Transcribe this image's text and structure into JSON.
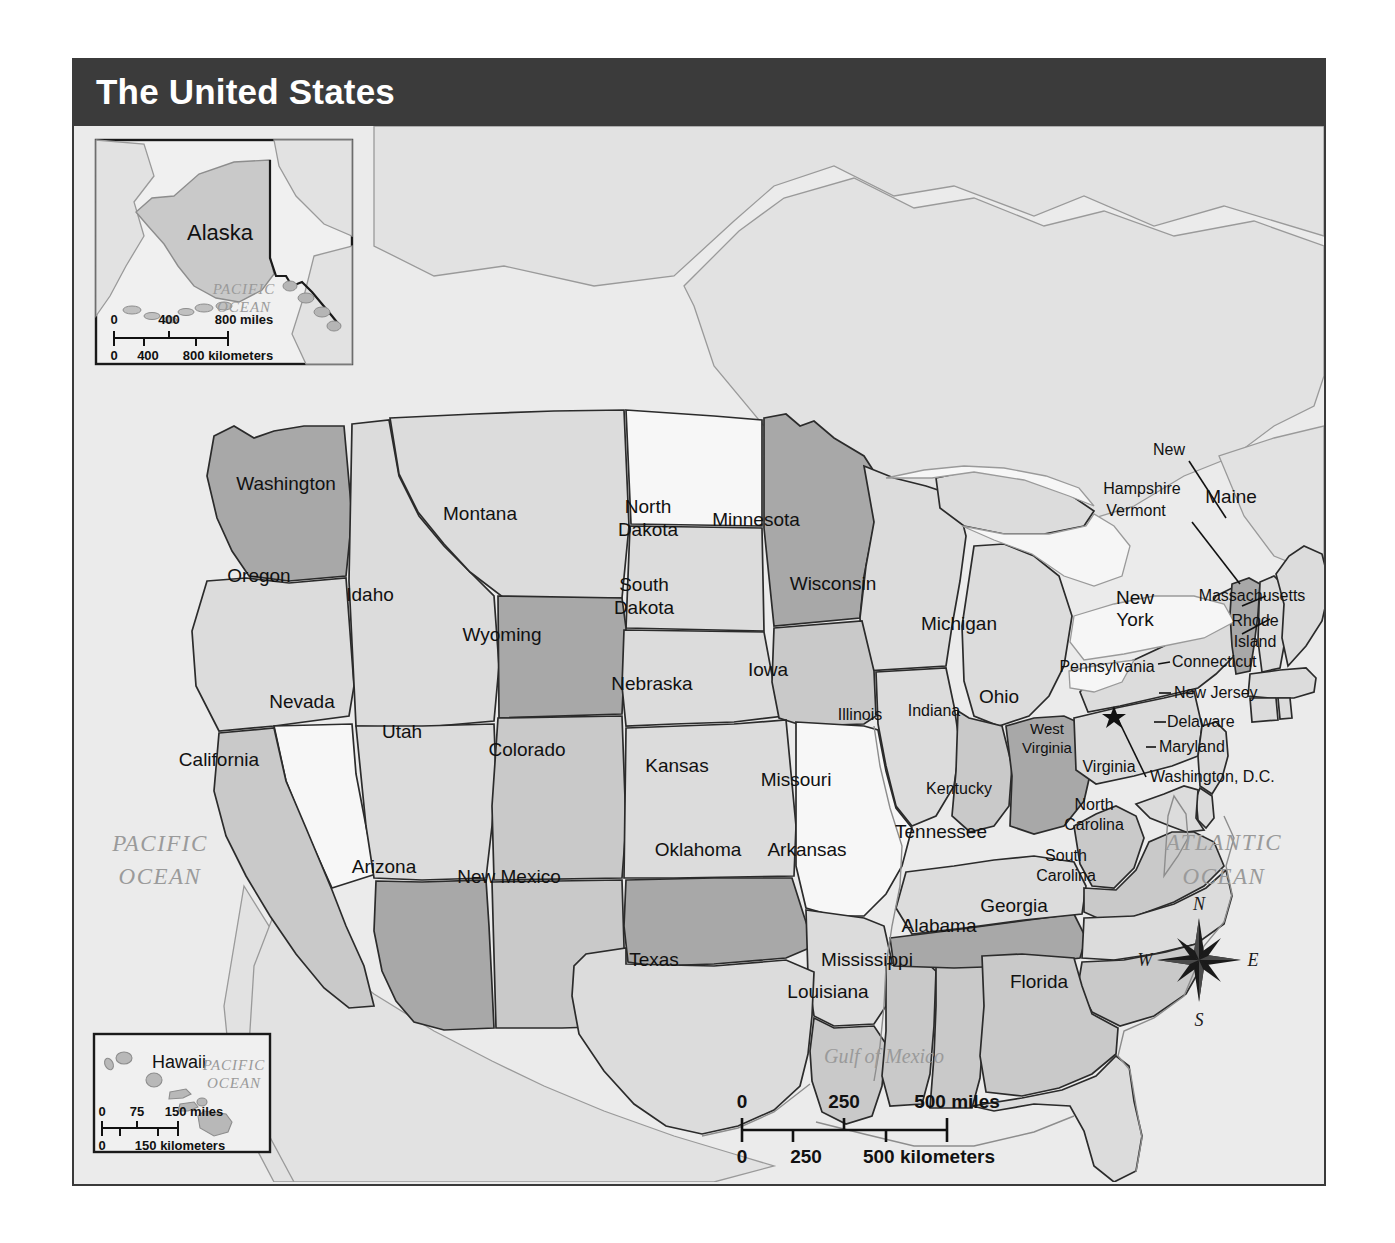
{
  "title": "The United States",
  "map": {
    "background_color": "#ebebeb",
    "title_bar_color": "#3b3b3b",
    "border_color": "#3a3a3a"
  },
  "state_labels": [
    {
      "name": "Washington",
      "line2": ""
    },
    {
      "name": "Oregon",
      "line2": ""
    },
    {
      "name": "Idaho",
      "line2": ""
    },
    {
      "name": "Montana",
      "line2": ""
    },
    {
      "name": "North",
      "line2": "Dakota"
    },
    {
      "name": "South",
      "line2": "Dakota"
    },
    {
      "name": "Minnesota",
      "line2": ""
    },
    {
      "name": "Wisconsin",
      "line2": ""
    },
    {
      "name": "Michigan",
      "line2": ""
    },
    {
      "name": "Wyoming",
      "line2": ""
    },
    {
      "name": "Nebraska",
      "line2": ""
    },
    {
      "name": "Iowa",
      "line2": ""
    },
    {
      "name": "Illinois",
      "line2": ""
    },
    {
      "name": "Indiana",
      "line2": ""
    },
    {
      "name": "Ohio",
      "line2": ""
    },
    {
      "name": "Nevada",
      "line2": ""
    },
    {
      "name": "Utah",
      "line2": ""
    },
    {
      "name": "Colorado",
      "line2": ""
    },
    {
      "name": "Kansas",
      "line2": ""
    },
    {
      "name": "Missouri",
      "line2": ""
    },
    {
      "name": "California",
      "line2": ""
    },
    {
      "name": "Arizona",
      "line2": ""
    },
    {
      "name": "New Mexico",
      "line2": ""
    },
    {
      "name": "Oklahoma",
      "line2": ""
    },
    {
      "name": "Arkansas",
      "line2": ""
    },
    {
      "name": "Texas",
      "line2": ""
    },
    {
      "name": "Louisiana",
      "line2": ""
    },
    {
      "name": "Mississippi",
      "line2": ""
    },
    {
      "name": "Alabama",
      "line2": ""
    },
    {
      "name": "Georgia",
      "line2": ""
    },
    {
      "name": "Florida",
      "line2": ""
    },
    {
      "name": "Tennessee",
      "line2": ""
    },
    {
      "name": "Kentucky",
      "line2": ""
    },
    {
      "name": "West",
      "line2": "Virginia"
    },
    {
      "name": "Virginia",
      "line2": ""
    },
    {
      "name": "North",
      "line2": "Carolina"
    },
    {
      "name": "South",
      "line2": "Carolina"
    },
    {
      "name": "Pennsylvania",
      "line2": ""
    },
    {
      "name": "New",
      "line2": "York"
    },
    {
      "name": "Maine",
      "line2": ""
    },
    {
      "name": "New",
      "line2": "Hampshire"
    },
    {
      "name": "Vermont",
      "line2": ""
    },
    {
      "name": "Massachusetts",
      "line2": ""
    },
    {
      "name": "Rhode",
      "line2": "Island"
    },
    {
      "name": "Connecticut",
      "line2": ""
    },
    {
      "name": "New Jersey",
      "line2": ""
    },
    {
      "name": "Delaware",
      "line2": ""
    },
    {
      "name": "Maryland",
      "line2": ""
    },
    {
      "name": "Washington, D.C.",
      "line2": ""
    },
    {
      "name": "Alaska",
      "line2": ""
    },
    {
      "name": "Hawaii",
      "line2": ""
    }
  ],
  "labels": {
    "washington": "Washington",
    "oregon": "Oregon",
    "idaho": "Idaho",
    "montana": "Montana",
    "north_dakota_1": "North",
    "north_dakota_2": "Dakota",
    "south_dakota_1": "South",
    "south_dakota_2": "Dakota",
    "minnesota": "Minnesota",
    "wisconsin": "Wisconsin",
    "michigan": "Michigan",
    "wyoming": "Wyoming",
    "nebraska": "Nebraska",
    "iowa": "Iowa",
    "illinois": "Illinois",
    "indiana": "Indiana",
    "ohio": "Ohio",
    "nevada": "Nevada",
    "utah": "Utah",
    "colorado": "Colorado",
    "kansas": "Kansas",
    "missouri": "Missouri",
    "california": "California",
    "arizona": "Arizona",
    "new_mexico": "New Mexico",
    "oklahoma": "Oklahoma",
    "arkansas": "Arkansas",
    "texas": "Texas",
    "louisiana": "Louisiana",
    "mississippi": "Mississippi",
    "alabama": "Alabama",
    "georgia": "Georgia",
    "florida": "Florida",
    "tennessee": "Tennessee",
    "kentucky": "Kentucky",
    "west_virginia_1": "West",
    "west_virginia_2": "Virginia",
    "virginia": "Virginia",
    "north_carolina_1": "North",
    "north_carolina_2": "Carolina",
    "south_carolina_1": "South",
    "south_carolina_2": "Carolina",
    "pennsylvania": "Pennsylvania",
    "new_york_1": "New",
    "new_york_2": "York",
    "maine": "Maine",
    "new_hampshire_1": "New",
    "new_hampshire_2": "Hampshire",
    "vermont": "Vermont",
    "massachusetts": "Massachusetts",
    "rhode_island_1": "Rhode",
    "rhode_island_2": "Island",
    "connecticut": "Connecticut",
    "new_jersey": "New Jersey",
    "delaware": "Delaware",
    "maryland": "Maryland",
    "washington_dc": "Washington, D.C.",
    "alaska": "Alaska",
    "hawaii": "Hawaii"
  },
  "water_labels": {
    "pacific_1": "PACIFIC",
    "pacific_2": "OCEAN",
    "atlantic_1": "ATLANTIC",
    "atlantic_2": "OCEAN",
    "gulf_of_mexico": "Gulf of Mexico",
    "alaska_pacific_1": "PACIFIC",
    "alaska_pacific_2": "OCEAN",
    "hawaii_pacific_1": "PACIFIC",
    "hawaii_pacific_2": "OCEAN"
  },
  "compass": {
    "north": "N",
    "east": "E",
    "south": "S",
    "west": "W"
  },
  "main_scale": {
    "miles": {
      "t0": "0",
      "t1": "250",
      "t2": "500 miles"
    },
    "kilometers": {
      "t0": "0",
      "t1": "250",
      "t2": "500 kilometers"
    }
  },
  "alaska_scale": {
    "miles": {
      "t0": "0",
      "t1": "400",
      "t2": "800 miles"
    },
    "kilometers": {
      "t0": "0",
      "t1": "400",
      "t2": "800 kilometers"
    }
  },
  "hawaii_scale": {
    "miles": {
      "t0": "0",
      "t1": "75",
      "t2": "150 miles"
    },
    "kilometers": {
      "t0": "0",
      "t1": "150 kilometers"
    }
  },
  "shading": {
    "white": "#f7f7f7",
    "light": "#dcdcdc",
    "medium": "#c9c9c9",
    "dark": "#a8a8a8",
    "water": "#f2f2f2",
    "outline": "#2b2b2b"
  }
}
